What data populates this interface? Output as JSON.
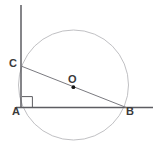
{
  "figure": {
    "kind": "geometry-diagram",
    "width": 156,
    "height": 147,
    "background_color": "#ffffff",
    "labels": {
      "A": "A",
      "B": "B",
      "C": "C",
      "O": "O"
    },
    "colors": {
      "circle_stroke": "#b9b9bc",
      "line_stroke": "#5d5d62",
      "chord_stroke": "#7a7a80",
      "center_dot": "#141414",
      "right_angle_stroke": "#5d5d62",
      "label_text": "#3a3a3a"
    },
    "geometry": {
      "circle": {
        "cx": 73.5,
        "cy": 85,
        "r": 55
      },
      "points": {
        "A": {
          "x": 21,
          "y": 107.5
        },
        "B": {
          "x": 126.5,
          "y": 107.5
        },
        "C": {
          "x": 21,
          "y": 66
        },
        "O": {
          "x": 73.5,
          "y": 87
        }
      },
      "vertical_line": {
        "x1": 21,
        "y1": 5,
        "x2": 21,
        "y2": 108
      },
      "horizontal_line": {
        "x1": 17,
        "y1": 107.5,
        "x2": 152,
        "y2": 107.5
      },
      "chord_CB": {
        "x1": 21,
        "y1": 66,
        "x2": 126.5,
        "y2": 107.5
      },
      "right_angle_marker": {
        "x": 22,
        "y": 96.5,
        "size": 10.5
      },
      "center_dot_radius": 1.9
    }
  }
}
